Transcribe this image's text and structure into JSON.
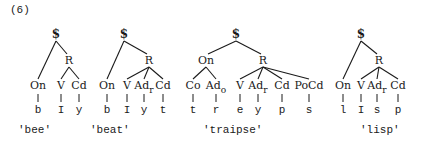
{
  "example_number": "(6)",
  "trees": [
    {
      "id": "bee",
      "gloss": "'bee'",
      "root": {
        "label": "$",
        "x": 56,
        "y": 38
      },
      "rime": {
        "label": "R",
        "x": 69,
        "y": 64
      },
      "onset_node": null,
      "categories": [
        {
          "label": "On",
          "sub": "",
          "x": 38,
          "segment": "b",
          "parent": "root"
        },
        {
          "label": "V",
          "sub": "",
          "x": 61,
          "segment": "I",
          "parent": "rime"
        },
        {
          "label": "Cd",
          "sub": "",
          "x": 79,
          "segment": "y",
          "parent": "rime"
        }
      ],
      "gloss_x": 18
    },
    {
      "id": "beat",
      "gloss": "'beat'",
      "root": {
        "label": "$",
        "x": 124,
        "y": 38
      },
      "rime": {
        "label": "R",
        "x": 149,
        "y": 64
      },
      "onset_node": null,
      "categories": [
        {
          "label": "On",
          "sub": "",
          "x": 107,
          "segment": "b",
          "parent": "root"
        },
        {
          "label": "V",
          "sub": "",
          "x": 127,
          "segment": "I",
          "parent": "rime"
        },
        {
          "label": "Ad",
          "sub": "r",
          "x": 144,
          "segment": "y",
          "parent": "rime"
        },
        {
          "label": "Cd",
          "sub": "",
          "x": 163,
          "segment": "t",
          "parent": "rime"
        }
      ],
      "gloss_x": 90
    },
    {
      "id": "traipse",
      "gloss": "'traipse'",
      "root": {
        "label": "$",
        "x": 236,
        "y": 38
      },
      "rime": {
        "label": "R",
        "x": 263,
        "y": 64
      },
      "onset_node": {
        "label": "On",
        "x": 206,
        "y": 64
      },
      "categories": [
        {
          "label": "Co",
          "sub": "",
          "x": 193,
          "segment": "t",
          "parent": "onset"
        },
        {
          "label": "Ad",
          "sub": "o",
          "x": 216,
          "segment": "r",
          "parent": "onset"
        },
        {
          "label": "V",
          "sub": "",
          "x": 240,
          "segment": "e",
          "parent": "rime"
        },
        {
          "label": "Ad",
          "sub": "r",
          "x": 258,
          "segment": "y",
          "parent": "rime"
        },
        {
          "label": "Cd",
          "sub": "",
          "x": 282,
          "segment": "p",
          "parent": "rime"
        },
        {
          "label": "PoCd",
          "sub": "",
          "x": 309,
          "segment": "s",
          "parent": "rime"
        }
      ],
      "gloss_x": 203
    },
    {
      "id": "lisp",
      "gloss": "'lisp'",
      "root": {
        "label": "$",
        "x": 361,
        "y": 38
      },
      "rime": {
        "label": "R",
        "x": 379,
        "y": 64
      },
      "onset_node": null,
      "categories": [
        {
          "label": "On",
          "sub": "",
          "x": 343,
          "segment": "l",
          "parent": "root"
        },
        {
          "label": "V",
          "sub": "",
          "x": 361,
          "segment": "I",
          "parent": "rime"
        },
        {
          "label": "Ad",
          "sub": "r",
          "x": 377,
          "segment": "s",
          "parent": "rime"
        },
        {
          "label": "Cd",
          "sub": "",
          "x": 398,
          "segment": "p",
          "parent": "rime"
        }
      ],
      "gloss_x": 360
    }
  ]
}
